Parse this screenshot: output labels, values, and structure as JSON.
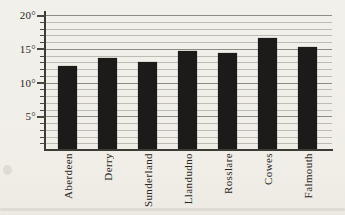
{
  "chart_data": {
    "type": "bar",
    "title": "",
    "categories": [
      "Aberdeen",
      "Derry",
      "Sunderland",
      "Llandudno",
      "Rosslare",
      "Cowes",
      "Falmouth"
    ],
    "values": [
      12.4,
      13.6,
      13.0,
      14.7,
      14.4,
      16.6,
      15.2
    ],
    "unit": "degrees",
    "xlabel": "",
    "ylabel": "",
    "ylim": [
      0,
      20.6
    ],
    "yticks": [
      5,
      10,
      15,
      20
    ],
    "ytick_labels": [
      "5°",
      "10°",
      "15°",
      "20°"
    ],
    "minor_tick_step": 1,
    "grid": "horizontal, minor line every degree, darker line at 5-degree majors",
    "legend": null,
    "bar_color": "#1c1b19",
    "background_color": "#f1efe9",
    "gridline_minor_color": "#bdbbb3",
    "gridline_major_color": "#8e8c84",
    "axis_color": "#3c3b35",
    "text_color": "#27251f"
  }
}
